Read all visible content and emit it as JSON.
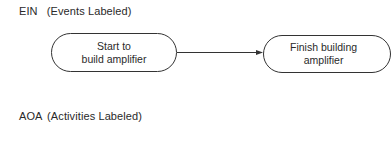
{
  "sections": [
    {
      "prefix": "EIN",
      "title": "(Events Labeled)"
    },
    {
      "prefix": "AOA",
      "title": "(Activities Labeled)"
    }
  ],
  "nodes": [
    {
      "id": "start",
      "lines": [
        "Start to",
        "build amplifier"
      ]
    },
    {
      "id": "finish",
      "lines": [
        "Finish building",
        "amplifier"
      ]
    }
  ],
  "edges": [
    {
      "from": "start",
      "to": "finish",
      "type": "arrow"
    }
  ],
  "colors": {
    "stroke": "#333333",
    "text": "#2a2a2a",
    "background": "#ffffff"
  }
}
